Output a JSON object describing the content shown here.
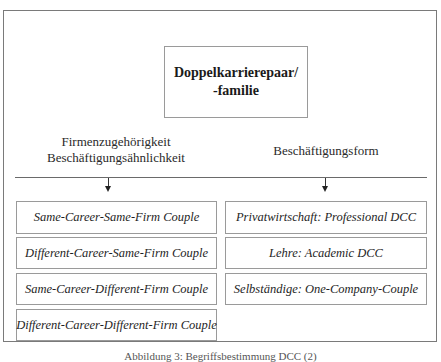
{
  "diagram": {
    "root": {
      "line1": "Doppelkarrierepaar/",
      "line2": "-familie"
    },
    "categories": [
      {
        "label_lines": [
          "Firmenzugehörigkeit",
          "Beschäftigungsähnlichkeit"
        ],
        "items": [
          "Same-Career-Same-Firm Couple",
          "Different-Career-Same-Firm Couple",
          "Same-Career-Different-Firm Couple",
          "Different-Career-Different-Firm Couple"
        ]
      },
      {
        "label_lines": [
          "Beschäftigungsform"
        ],
        "items": [
          "Privatwirtschaft: Professional DCC",
          "Lehre: Academic DCC",
          "Selbständige: One-Company-Couple"
        ]
      }
    ],
    "caption": "Abbildung 3: Begriffsbestimmung DCC (2)"
  }
}
